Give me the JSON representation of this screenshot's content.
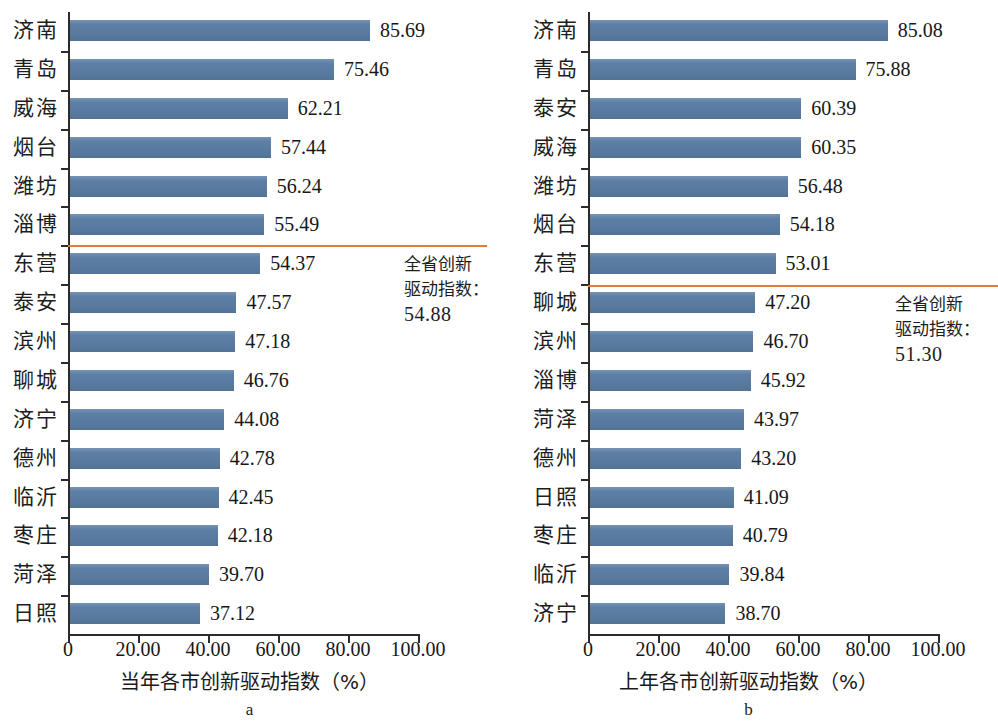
{
  "figure": {
    "width": 998,
    "height": 725,
    "bar_color": "#5c7fa6",
    "reference_line_color": "#e27c3e",
    "axis_color": "#2b2b2b"
  },
  "panels": [
    {
      "letter": "a",
      "x_title": "当年各市创新驱动指数（%）",
      "xticks": [
        "0",
        "20.00",
        "40.00",
        "60.00",
        "80.00",
        "100.00"
      ],
      "reference": {
        "label_line1": "全省创新",
        "label_line2": "驱动指数：",
        "value": "54.88"
      },
      "categories": [
        "济南",
        "青岛",
        "威海",
        "烟台",
        "潍坊",
        "淄博",
        "东营",
        "泰安",
        "滨州",
        "聊城",
        "济宁",
        "德州",
        "临沂",
        "枣庄",
        "菏泽",
        "日照"
      ],
      "values": [
        85.69,
        75.46,
        62.21,
        57.44,
        56.24,
        55.49,
        54.37,
        47.57,
        47.18,
        46.76,
        44.08,
        42.78,
        42.45,
        42.18,
        39.7,
        37.12
      ],
      "labels": [
        "85.69",
        "75.46",
        "62.21",
        "57.44",
        "56.24",
        "55.49",
        "54.37",
        "47.57",
        "47.18",
        "46.76",
        "44.08",
        "42.78",
        "42.45",
        "42.18",
        "39.70",
        "37.12"
      ]
    },
    {
      "letter": "b",
      "x_title": "上年各市创新驱动指数（%）",
      "xticks": [
        "0",
        "20.00",
        "40.00",
        "60.00",
        "80.00",
        "100.00"
      ],
      "reference": {
        "label_line1": "全省创新",
        "label_line2": "驱动指数：",
        "value": "51.30"
      },
      "categories": [
        "济南",
        "青岛",
        "泰安",
        "威海",
        "潍坊",
        "烟台",
        "东营",
        "聊城",
        "滨州",
        "淄博",
        "菏泽",
        "德州",
        "日照",
        "枣庄",
        "临沂",
        "济宁"
      ],
      "values": [
        85.08,
        75.88,
        60.39,
        60.35,
        56.48,
        54.18,
        53.01,
        47.2,
        46.7,
        45.92,
        43.97,
        43.2,
        41.09,
        40.79,
        39.84,
        38.7
      ],
      "labels": [
        "85.08",
        "75.88",
        "60.39",
        "60.35",
        "56.48",
        "54.18",
        "53.01",
        "47.20",
        "46.70",
        "45.92",
        "43.97",
        "43.20",
        "41.09",
        "40.79",
        "39.84",
        "38.70"
      ]
    }
  ],
  "chart_data": [
    {
      "type": "bar",
      "orientation": "horizontal",
      "title": "",
      "panel": "a",
      "xlabel": "当年各市创新驱动指数（%）",
      "ylabel": "",
      "xlim": [
        0,
        100
      ],
      "xticks": [
        0,
        20,
        40,
        60,
        80,
        100
      ],
      "xtick_labels": [
        "0",
        "20.00",
        "40.00",
        "60.00",
        "80.00",
        "100.00"
      ],
      "grid": false,
      "legend": false,
      "categories": [
        "济南",
        "青岛",
        "威海",
        "烟台",
        "潍坊",
        "淄博",
        "东营",
        "泰安",
        "滨州",
        "聊城",
        "济宁",
        "德州",
        "临沂",
        "枣庄",
        "菏泽",
        "日照"
      ],
      "values": [
        85.69,
        75.46,
        62.21,
        57.44,
        56.24,
        55.49,
        54.37,
        47.57,
        47.18,
        46.76,
        44.08,
        42.78,
        42.45,
        42.18,
        39.7,
        37.12
      ],
      "annotations": [
        {
          "type": "reference-line",
          "text": "全省创新驱动指数：54.88",
          "value": 54.88,
          "after_category": "淄博",
          "color": "#e27c3e"
        }
      ]
    },
    {
      "type": "bar",
      "orientation": "horizontal",
      "title": "",
      "panel": "b",
      "xlabel": "上年各市创新驱动指数（%）",
      "ylabel": "",
      "xlim": [
        0,
        100
      ],
      "xticks": [
        0,
        20,
        40,
        60,
        80,
        100
      ],
      "xtick_labels": [
        "0",
        "20.00",
        "40.00",
        "60.00",
        "80.00",
        "100.00"
      ],
      "grid": false,
      "legend": false,
      "categories": [
        "济南",
        "青岛",
        "泰安",
        "威海",
        "潍坊",
        "烟台",
        "东营",
        "聊城",
        "滨州",
        "淄博",
        "菏泽",
        "德州",
        "日照",
        "枣庄",
        "临沂",
        "济宁"
      ],
      "values": [
        85.08,
        75.88,
        60.39,
        60.35,
        56.48,
        54.18,
        53.01,
        47.2,
        46.7,
        45.92,
        43.97,
        43.2,
        41.09,
        40.79,
        39.84,
        38.7
      ],
      "annotations": [
        {
          "type": "reference-line",
          "text": "全省创新驱动指数：51.30",
          "value": 51.3,
          "after_category": "东营",
          "color": "#e27c3e"
        }
      ]
    }
  ]
}
